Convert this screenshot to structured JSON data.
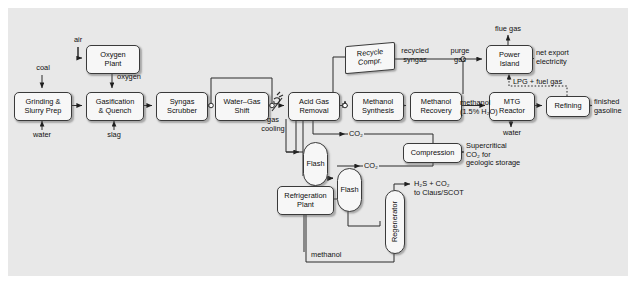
{
  "diagram": {
    "background_color": "#e8e8e8",
    "node_fill": "#f7f7f7",
    "line_color": "#2a2a2a",
    "nodes": [
      {
        "id": "oxygen_plant",
        "label": "Oxygen\nPlant",
        "shape": "rounded",
        "x": 86,
        "y": 45,
        "w": 52,
        "h": 27
      },
      {
        "id": "grinding",
        "label": "Grinding &\nSlurry Prep",
        "shape": "rounded",
        "x": 14,
        "y": 92,
        "w": 56,
        "h": 27
      },
      {
        "id": "gasification",
        "label": "Gasification\n& Quench",
        "shape": "rounded",
        "x": 86,
        "y": 92,
        "w": 56,
        "h": 27
      },
      {
        "id": "syngas_scrubber",
        "label": "Syngas\nScrubber",
        "shape": "rounded",
        "x": 156,
        "y": 92,
        "w": 50,
        "h": 27
      },
      {
        "id": "wgs",
        "label": "Water–Gas\nShift",
        "shape": "rounded",
        "x": 215,
        "y": 92,
        "w": 52,
        "h": 27
      },
      {
        "id": "acid_gas_removal",
        "label": "Acid Gas\nRemoval",
        "shape": "rounded",
        "x": 288,
        "y": 92,
        "w": 50,
        "h": 27
      },
      {
        "id": "recycle_compr",
        "label": "Recycle\nCompr.",
        "shape": "skew",
        "x": 345,
        "y": 44,
        "w": 48,
        "h": 26
      },
      {
        "id": "methanol_synthesis",
        "label": "Methanol\nSynthesis",
        "shape": "rounded",
        "x": 352,
        "y": 92,
        "w": 50,
        "h": 27
      },
      {
        "id": "methanol_recovery",
        "label": "Methanol\nRecovery",
        "shape": "rounded",
        "x": 410,
        "y": 92,
        "w": 50,
        "h": 27
      },
      {
        "id": "power_island",
        "label": "Power\nIsland",
        "shape": "rounded",
        "x": 486,
        "y": 45,
        "w": 45,
        "h": 27
      },
      {
        "id": "mtg_reactor",
        "label": "MTG\nReactor",
        "shape": "rounded",
        "x": 489,
        "y": 92,
        "w": 44,
        "h": 27
      },
      {
        "id": "refining",
        "label": "Refining",
        "shape": "rounded",
        "x": 546,
        "y": 96,
        "w": 42,
        "h": 19
      },
      {
        "id": "flash1",
        "label": "Flash",
        "shape": "vessel",
        "x": 303,
        "y": 142,
        "w": 23,
        "h": 42
      },
      {
        "id": "flash2",
        "label": "Flash",
        "shape": "vessel",
        "x": 337,
        "y": 168,
        "w": 23,
        "h": 42
      },
      {
        "id": "compression",
        "label": "Compression",
        "shape": "rounded",
        "x": 403,
        "y": 143,
        "w": 57,
        "h": 18
      },
      {
        "id": "refrigeration",
        "label": "Refrigeration\nPlant",
        "shape": "rounded",
        "x": 277,
        "y": 186,
        "w": 55,
        "h": 27
      },
      {
        "id": "regenerator",
        "label": "Regenerator",
        "shape": "vessel-rot",
        "x": 385,
        "y": 190,
        "w": 18,
        "h": 62
      }
    ],
    "stream_labels": [
      {
        "id": "air",
        "text": "air",
        "x": 75,
        "y": 42
      },
      {
        "id": "coal",
        "text": "coal",
        "x": 40,
        "y": 70
      },
      {
        "id": "oxygen",
        "text": "oxygen",
        "x": 104,
        "y": 76
      },
      {
        "id": "water",
        "text": "water",
        "x": 30,
        "y": 133
      },
      {
        "id": "slag",
        "text": "slag",
        "x": 105,
        "y": 133
      },
      {
        "id": "gas_cooling",
        "text": "gas\ncooling",
        "x": 264,
        "y": 120
      },
      {
        "id": "recycled_syngas",
        "text": "recycled\nsyngas",
        "x": 399,
        "y": 52
      },
      {
        "id": "purge_gas",
        "text": "purge\ngas",
        "x": 452,
        "y": 52
      },
      {
        "id": "flue_gas",
        "text": "flue gas",
        "x": 490,
        "y": 25
      },
      {
        "id": "net_export_electricity",
        "text": "net export\nelectricity",
        "x": 538,
        "y": 48
      },
      {
        "id": "lpg_fuel_gas",
        "text": "LPG + fuel gas",
        "x": 502,
        "y": 82
      },
      {
        "id": "methanol_15",
        "text": "methanol\n(1.5% H₂O)",
        "x": 459,
        "y": 100
      },
      {
        "id": "water2",
        "text": "water",
        "x": 500,
        "y": 130
      },
      {
        "id": "finished_gasoline",
        "text": "finished\ngasoline",
        "x": 594,
        "y": 98
      },
      {
        "id": "co2_top",
        "text": "CO₂",
        "x": 349,
        "y": 131
      },
      {
        "id": "co2_mid",
        "text": "CO₂",
        "x": 364,
        "y": 163
      },
      {
        "id": "supercritical_co2",
        "text": "Supercritical\nCO₂ for\ngeologic storage",
        "x": 466,
        "y": 143
      },
      {
        "id": "h2s_co2_claus",
        "text": "H₂S + CO₂\nto Claus/SCOT",
        "x": 414,
        "y": 188
      },
      {
        "id": "methanol_return",
        "text": "methanol",
        "x": 312,
        "y": 249
      }
    ]
  }
}
